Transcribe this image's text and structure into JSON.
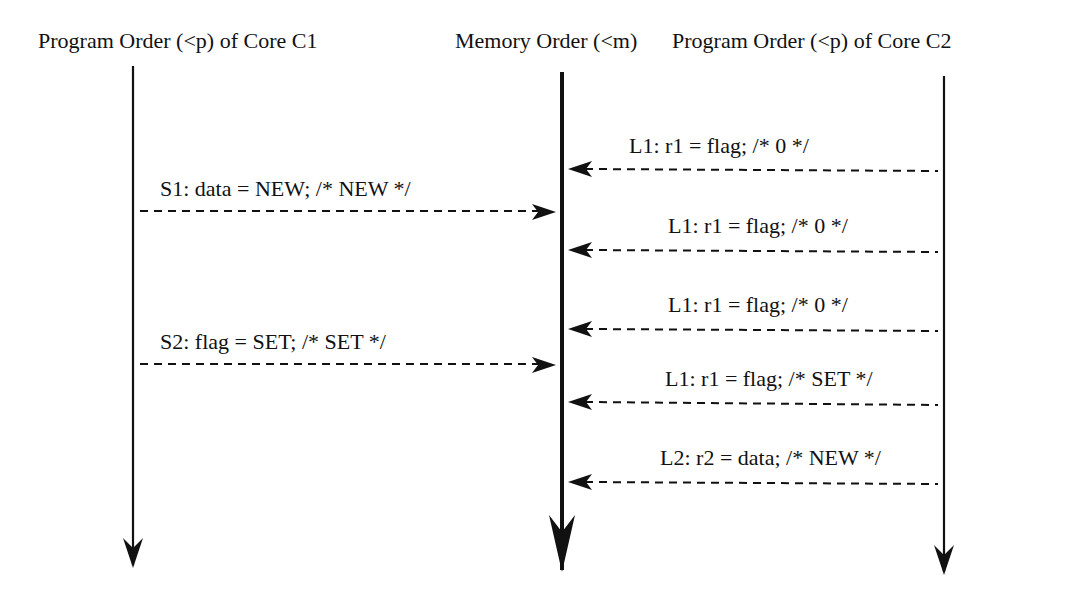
{
  "headers": {
    "core_c1": "Program Order (<p) of Core C1",
    "memory": "Memory Order (<m)",
    "core_c2": "Program Order (<p) of Core C2"
  },
  "stores": [
    {
      "label": "S1: data = NEW; /* NEW */",
      "from": "core_c1",
      "to": "memory"
    },
    {
      "label": "S2: flag = SET; /* SET */",
      "from": "core_c1",
      "to": "memory"
    }
  ],
  "loads": [
    {
      "label": "L1: r1 = flag; /* 0 */",
      "from": "core_c2",
      "to": "memory"
    },
    {
      "label": "L1: r1 = flag; /* 0 */",
      "from": "core_c2",
      "to": "memory"
    },
    {
      "label": "L1: r1 = flag; /* 0 */",
      "from": "core_c2",
      "to": "memory"
    },
    {
      "label": "L1: r1 = flag; /* SET */",
      "from": "core_c2",
      "to": "memory"
    },
    {
      "label": "L2: r2 = data; /* NEW */",
      "from": "core_c2",
      "to": "memory"
    }
  ],
  "colors": {
    "line": "#111111",
    "background": "#ffffff"
  }
}
